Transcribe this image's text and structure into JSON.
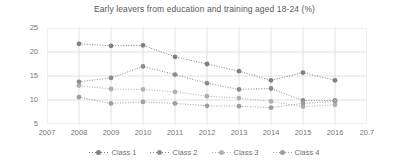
{
  "chart_data": {
    "type": "line",
    "title": "Early leavers from education and training aged 18-24 (%)",
    "xlabel": "",
    "ylabel": "",
    "x": [
      "2008",
      "2009",
      "2010",
      "2011",
      "2012",
      "2013",
      "2014",
      "2015",
      "2016"
    ],
    "axis_tick_labels": [
      "2007",
      "2008",
      "2009",
      "2010",
      "2011",
      "2012",
      "2013",
      "2014",
      "2015",
      "2016",
      "20.7"
    ],
    "ytick_labels": [
      "25",
      "20",
      "15",
      "10",
      "5"
    ],
    "ytick_values": [
      25,
      20,
      15,
      10,
      5
    ],
    "ylim": [
      5,
      25
    ],
    "grid": true,
    "legend_position": "bottom",
    "marker": "circle",
    "linestyle": "dotted",
    "series": [
      {
        "name": "Class 1",
        "color": "#808080",
        "values": [
          21.7,
          21.3,
          21.4,
          19.0,
          17.5,
          16.0,
          14.1,
          15.7,
          14.1
        ]
      },
      {
        "name": "Class 2",
        "color": "#8c8c8c",
        "values": [
          13.8,
          14.6,
          17.0,
          15.3,
          13.5,
          12.2,
          12.4,
          9.9,
          9.9
        ]
      },
      {
        "name": "Class 3",
        "color": "#b0b0b0",
        "values": [
          13.0,
          12.3,
          12.2,
          11.7,
          10.8,
          10.4,
          9.7,
          8.6,
          9.0
        ]
      },
      {
        "name": "Class 4",
        "color": "#9e9e9e",
        "values": [
          10.6,
          9.3,
          9.6,
          9.3,
          8.8,
          8.7,
          8.4,
          9.3,
          9.7
        ]
      }
    ],
    "colors": {
      "grid": "#d9d9d9",
      "axis_text": "#787878",
      "title_text": "#595959",
      "background": "#ffffff"
    }
  }
}
